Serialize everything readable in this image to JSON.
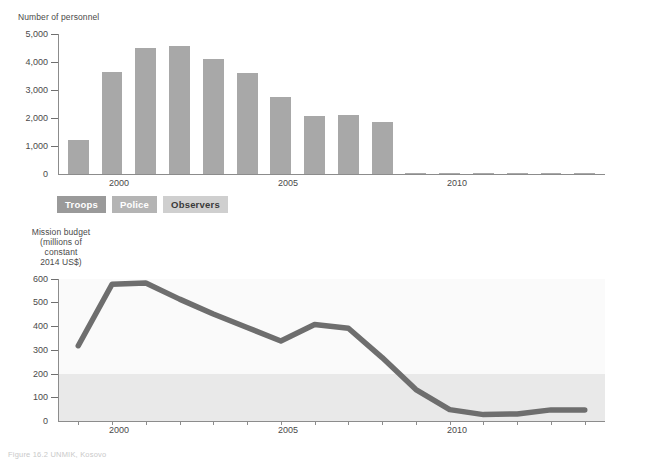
{
  "chart_data": [
    {
      "type": "bar",
      "title": "",
      "ylabel": "Number of personnel",
      "xlabel": "",
      "ylim": [
        0,
        5000
      ],
      "ytick_labels": [
        "0",
        "1,000",
        "2,000",
        "3,000",
        "4,000",
        "5,000"
      ],
      "ytick_values": [
        0,
        1000,
        2000,
        3000,
        4000,
        5000
      ],
      "xtick_labels": [
        "2000",
        "2005",
        "2010"
      ],
      "xtick_values": [
        2000,
        2005,
        2010
      ],
      "xlim": [
        1998.4,
        2014.6
      ],
      "grid": false,
      "categories": [
        1999,
        2000,
        2001,
        2002,
        2003,
        2004,
        2005,
        2006,
        2007,
        2008,
        2009,
        2010,
        2011,
        2012,
        2013,
        2014
      ],
      "values": [
        1200,
        3600,
        4470,
        4530,
        4070,
        3590,
        2730,
        2070,
        2080,
        1850,
        20,
        10,
        8,
        8,
        8,
        8
      ],
      "legend": [
        "Troops",
        "Police",
        "Observers"
      ],
      "legend_position": "below-axis",
      "bar_color": "#a8a8a8"
    },
    {
      "type": "line",
      "title": "",
      "ylabel": "Mission budget\n(millions of\nconstant\n2014 US$)",
      "xlabel": "",
      "ylim": [
        0,
        600
      ],
      "ytick_labels": [
        "0",
        "100",
        "200",
        "300",
        "400",
        "500",
        "600"
      ],
      "ytick_values": [
        0,
        100,
        200,
        300,
        400,
        500,
        600
      ],
      "xtick_labels": [
        "2000",
        "2005",
        "2010"
      ],
      "xtick_values": [
        2000,
        2005,
        2010
      ],
      "xlim": [
        1998.4,
        2014.6
      ],
      "grid": false,
      "x": [
        1999,
        2000,
        2001,
        2002,
        2003,
        2004,
        2005,
        2006,
        2007,
        2008,
        2009,
        2010,
        2011,
        2012,
        2013,
        2014
      ],
      "values": [
        318,
        578,
        583,
        515,
        452,
        395,
        338,
        408,
        392,
        268,
        133,
        48,
        27,
        30,
        47,
        47
      ],
      "line_color": "#6e6e6e",
      "plot_bands": [
        {
          "from": 200,
          "to": 600,
          "color": "#fafafa"
        },
        {
          "from": 0,
          "to": 200,
          "color": "#e9e9e9"
        }
      ]
    }
  ],
  "personnel": {
    "axis_title": "Number of personnel",
    "yticks": [
      "5,000",
      "4,000",
      "3,000",
      "2,000",
      "1,000",
      "0"
    ],
    "xticks": [
      "2000",
      "2005",
      "2010"
    ]
  },
  "budget": {
    "axis_title_lines": [
      "Mission budget",
      "(millions of",
      "constant",
      "2014 US$)"
    ],
    "yticks": [
      "600",
      "500",
      "400",
      "300",
      "200",
      "100",
      "0"
    ],
    "xticks": [
      "2000",
      "2005",
      "2010"
    ]
  },
  "legend": {
    "troops": "Troops",
    "police": "Police",
    "observers": "Observers"
  },
  "caption": {
    "text": "Figure 16.2  UNMIK, Kosovo"
  },
  "colors": {
    "bar": "#a8a8a8",
    "line": "#6e6e6e",
    "band_upper": "#fafafa",
    "band_lower": "#e9e9e9",
    "axis": "#8c8c8c",
    "text": "#4a4a4a"
  }
}
